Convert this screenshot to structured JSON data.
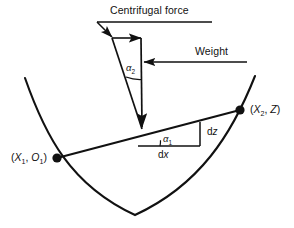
{
  "figure": {
    "background_color": "#ffffff",
    "stroke_color": "#111111",
    "width": 294,
    "height": 228
  },
  "labels": {
    "centrifugal_force": "Centrifugal force",
    "weight": "Weight",
    "alpha_2_symbol": "α",
    "alpha_2_sub": "2",
    "alpha_1_symbol": "α",
    "alpha_1_sub": "1",
    "dz": "z",
    "dz_prefix": "d",
    "dx": "x",
    "dx_prefix": "d",
    "point_left_open": "(",
    "point_left_x": "X",
    "point_left_x_sub": "1",
    "point_left_sep": ", ",
    "point_left_o": "O",
    "point_left_o_sub": "1",
    "point_left_close": ")",
    "point_right_open": "(",
    "point_right_x": "X",
    "point_right_x_sub": "2",
    "point_right_sep": ", ",
    "point_right_z": "Z",
    "point_right_close": ")"
  },
  "geometry": {
    "curve_left_end": [
      25,
      78
    ],
    "curve_bottom": [
      135,
      215
    ],
    "curve_right_end": [
      255,
      76
    ],
    "point_left": [
      57,
      158
    ],
    "point_right": [
      240,
      110
    ],
    "triangle_apex": [
      112,
      38
    ],
    "triangle_top_right": [
      141,
      38
    ],
    "triangle_bottom": [
      142,
      129
    ],
    "dx_left": [
      138,
      146
    ],
    "dx_right": [
      200,
      146
    ],
    "dz_top": [
      200,
      122
    ],
    "centrifugal_line_y": 22,
    "centrifugal_line_x1": 97,
    "centrifugal_line_x2": 212,
    "weight_line_y": 62,
    "weight_line_x1": 143,
    "weight_line_x2": 247
  }
}
